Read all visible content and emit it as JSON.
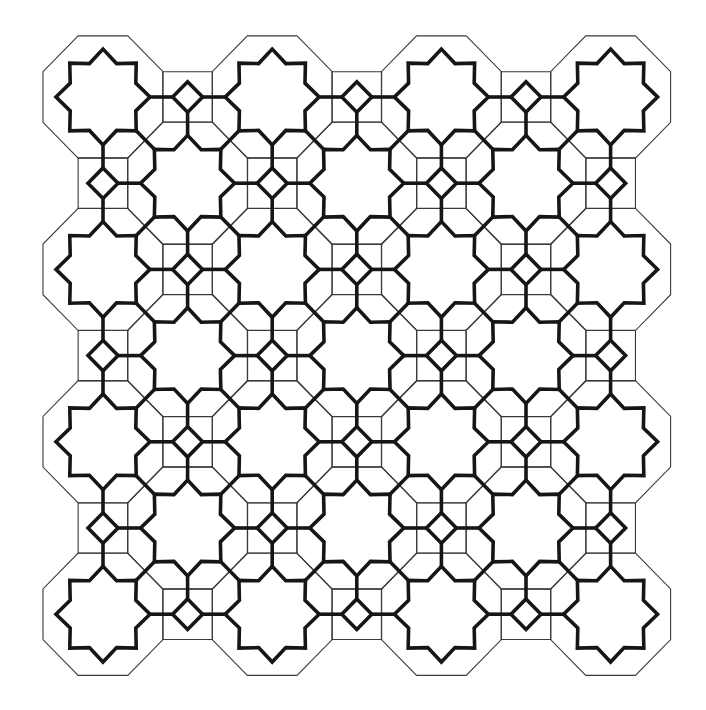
{
  "pattern": {
    "description": "Geometric star tiling on an octagon-square (4.8.8) lattice",
    "colors": {
      "background": "#ffffff",
      "thin_line": "#3a3a3a",
      "thick_line": "#161616"
    },
    "grid": {
      "columns": 7,
      "rows": 7,
      "origin_x": 103,
      "origin_y": 97,
      "step_x": 84.6,
      "step_y": 86.2,
      "octagon_where": "i+j even",
      "square_where": "i+j odd"
    },
    "octagon": {
      "inradius": 60
    },
    "star": {
      "points": 8,
      "outer_radius": 47,
      "inner_radius": 35.5
    },
    "diamond": {
      "half_diagonal": 15
    }
  }
}
